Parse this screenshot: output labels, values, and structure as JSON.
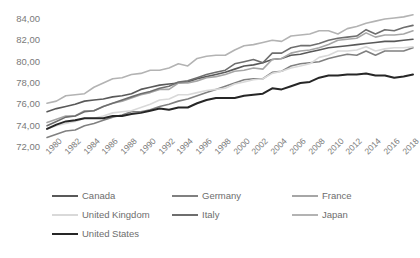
{
  "chart_data": {
    "type": "line",
    "title": "",
    "xlabel": "",
    "ylabel": "",
    "ylim": [
      72.0,
      84.0
    ],
    "ytick_step": 2.0,
    "ytick_labels": [
      "84,00",
      "82,00",
      "80,00",
      "78,00",
      "76,00",
      "74,00",
      "72,00"
    ],
    "ytick_values": [
      84.0,
      82.0,
      80.0,
      78.0,
      76.0,
      74.0,
      72.0
    ],
    "grid": false,
    "legend_position": "bottom",
    "decimal_separator": ",",
    "xtick_labels": [
      "1980",
      "1982",
      "1984",
      "1986",
      "1988",
      "1990",
      "1992",
      "1994",
      "1996",
      "1998",
      "2000",
      "2002",
      "2004",
      "2006",
      "2008",
      "2010",
      "2012",
      "2014",
      "2016",
      "2018"
    ],
    "x": [
      1980,
      1981,
      1982,
      1983,
      1984,
      1985,
      1986,
      1987,
      1988,
      1989,
      1990,
      1991,
      1992,
      1993,
      1994,
      1995,
      1996,
      1997,
      1998,
      1999,
      2000,
      2001,
      2002,
      2003,
      2004,
      2005,
      2006,
      2007,
      2008,
      2009,
      2010,
      2011,
      2012,
      2013,
      2014,
      2015,
      2016,
      2017,
      2018,
      2019
    ],
    "xlim": [
      1980,
      2019
    ],
    "series": [
      {
        "name": "Canada",
        "color": "#595959",
        "width": 1.6,
        "values": [
          75.3,
          75.6,
          75.8,
          76.0,
          76.3,
          76.4,
          76.5,
          76.7,
          76.8,
          77.0,
          77.4,
          77.6,
          77.8,
          77.9,
          78.0,
          78.1,
          78.4,
          78.6,
          78.8,
          79.0,
          79.3,
          79.6,
          79.7,
          79.9,
          80.2,
          80.3,
          80.6,
          80.7,
          80.9,
          81.1,
          81.3,
          81.4,
          81.5,
          81.6,
          81.7,
          81.8,
          81.9,
          81.9,
          82.0,
          82.1
        ]
      },
      {
        "name": "Germany",
        "color": "#808080",
        "width": 1.6,
        "values": [
          72.9,
          73.2,
          73.5,
          73.6,
          74.0,
          74.2,
          74.5,
          74.8,
          75.0,
          75.3,
          75.3,
          75.5,
          75.8,
          76.0,
          76.3,
          76.5,
          76.8,
          77.1,
          77.4,
          77.7,
          78.0,
          78.3,
          78.4,
          78.4,
          79.0,
          79.1,
          79.6,
          79.8,
          79.9,
          80.0,
          80.3,
          80.5,
          80.7,
          80.6,
          81.0,
          80.6,
          81.0,
          81.0,
          81.0,
          81.3
        ]
      },
      {
        "name": "France",
        "color": "#a6a6a6",
        "width": 1.6,
        "values": [
          74.3,
          74.6,
          74.9,
          74.9,
          75.4,
          75.4,
          75.8,
          76.1,
          76.3,
          76.6,
          76.9,
          77.1,
          77.4,
          77.4,
          78.0,
          78.0,
          78.2,
          78.5,
          78.6,
          78.8,
          79.1,
          79.2,
          79.4,
          79.3,
          80.2,
          80.3,
          80.8,
          81.0,
          81.1,
          81.3,
          81.6,
          82.0,
          82.1,
          82.2,
          82.7,
          82.3,
          82.5,
          82.5,
          82.6,
          82.9
        ]
      },
      {
        "name": "United Kingdom",
        "color": "#d9d9d9",
        "width": 1.6,
        "values": [
          73.7,
          74.0,
          74.2,
          74.4,
          74.7,
          74.7,
          74.9,
          75.2,
          75.3,
          75.4,
          75.7,
          76.0,
          76.4,
          76.5,
          76.9,
          76.9,
          77.1,
          77.3,
          77.4,
          77.5,
          77.9,
          78.1,
          78.3,
          78.4,
          78.9,
          79.1,
          79.4,
          79.6,
          79.8,
          80.4,
          80.6,
          81.0,
          81.0,
          81.1,
          81.4,
          81.0,
          81.2,
          81.3,
          81.3,
          81.4
        ]
      },
      {
        "name": "Italy",
        "color": "#6e6e6e",
        "width": 1.6,
        "values": [
          74.0,
          74.4,
          74.8,
          74.9,
          75.3,
          75.4,
          75.8,
          76.1,
          76.4,
          76.7,
          77.0,
          77.2,
          77.5,
          77.7,
          78.1,
          78.2,
          78.5,
          78.8,
          79.0,
          79.2,
          79.8,
          80.0,
          80.2,
          79.9,
          80.8,
          80.8,
          81.3,
          81.5,
          81.5,
          81.7,
          82.0,
          82.2,
          82.3,
          82.4,
          83.0,
          82.6,
          83.0,
          82.9,
          83.2,
          83.4
        ]
      },
      {
        "name": "Japan",
        "color": "#b3b3b3",
        "width": 1.6,
        "values": [
          76.1,
          76.3,
          76.8,
          76.9,
          77.0,
          77.6,
          78.0,
          78.4,
          78.5,
          78.8,
          78.9,
          79.2,
          79.2,
          79.4,
          79.8,
          79.6,
          80.3,
          80.5,
          80.6,
          80.6,
          81.1,
          81.5,
          81.6,
          81.8,
          82.0,
          81.9,
          82.4,
          82.5,
          82.6,
          82.9,
          82.9,
          82.6,
          83.1,
          83.3,
          83.6,
          83.8,
          84.0,
          84.1,
          84.2,
          84.4
        ]
      },
      {
        "name": "United States",
        "color": "#262626",
        "width": 2.0,
        "values": [
          73.7,
          74.1,
          74.4,
          74.5,
          74.7,
          74.7,
          74.7,
          74.9,
          74.9,
          75.1,
          75.2,
          75.4,
          75.6,
          75.5,
          75.7,
          75.7,
          76.1,
          76.4,
          76.6,
          76.6,
          76.6,
          76.8,
          76.9,
          77.0,
          77.5,
          77.4,
          77.7,
          78.0,
          78.1,
          78.5,
          78.7,
          78.7,
          78.8,
          78.8,
          78.9,
          78.7,
          78.7,
          78.5,
          78.6,
          78.8
        ]
      }
    ]
  },
  "legend": {
    "rows": [
      [
        {
          "label": "Canada",
          "color": "#595959",
          "width": 2.2
        },
        {
          "label": "Germany",
          "color": "#808080",
          "width": 2.2
        },
        {
          "label": "France",
          "color": "#a6a6a6",
          "width": 2.2
        }
      ],
      [
        {
          "label": "United Kingdom",
          "color": "#d9d9d9",
          "width": 2.2
        },
        {
          "label": "Italy",
          "color": "#6e6e6e",
          "width": 2.2
        },
        {
          "label": "Japan",
          "color": "#b3b3b3",
          "width": 2.2
        }
      ],
      [
        {
          "label": "United States",
          "color": "#262626",
          "width": 2.6
        }
      ]
    ]
  }
}
